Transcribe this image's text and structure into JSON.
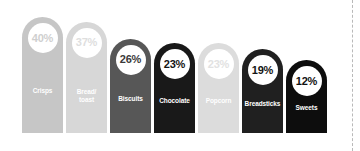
{
  "chart_data": {
    "type": "bar",
    "title": "",
    "subtitle": "",
    "xlabel": "",
    "ylabel": "",
    "ylim": [
      0,
      40
    ],
    "grid": false,
    "legend": "none",
    "orientation": "vertical",
    "bar_top_shape": "rounded-dome",
    "value_suffix": "%",
    "categories": [
      "Crisps",
      "Bread/\ntoast",
      "Biscuits",
      "Chocolate",
      "Popcorn",
      "Breadsticks",
      "Sweets"
    ],
    "values": [
      40,
      37,
      26,
      23,
      23,
      19,
      12
    ],
    "value_labels": [
      "40%",
      "37%",
      "26%",
      "23%",
      "23%",
      "19%",
      "12%"
    ],
    "bars": [
      {
        "category": "Crisps",
        "value": 40,
        "value_label": "40%",
        "bar_color": "#c6c6c6",
        "bubble_color": "#ffffff",
        "value_text_color": "#cfcfcf",
        "label_text_color": "#ffffff"
      },
      {
        "category": "Bread/\ntoast",
        "value": 37,
        "value_label": "37%",
        "bar_color": "#d7d7d7",
        "bubble_color": "#ffffff",
        "value_text_color": "#dedede",
        "label_text_color": "#ffffff"
      },
      {
        "category": "Biscuits",
        "value": 26,
        "value_label": "26%",
        "bar_color": "#575757",
        "bubble_color": "#ffffff",
        "value_text_color": "#3a3a3a",
        "label_text_color": "#ffffff"
      },
      {
        "category": "Chocolate",
        "value": 23,
        "value_label": "23%",
        "bar_color": "#191919",
        "bubble_color": "#ffffff",
        "value_text_color": "#141414",
        "label_text_color": "#ffffff"
      },
      {
        "category": "Popcorn",
        "value": 23,
        "value_label": "23%",
        "bar_color": "#dcdcdc",
        "bubble_color": "#ffffff",
        "value_text_color": "#e2e2e2",
        "label_text_color": "#ffffff"
      },
      {
        "category": "Breadsticks",
        "value": 19,
        "value_label": "19%",
        "bar_color": "#202020",
        "bubble_color": "#ffffff",
        "value_text_color": "#141414",
        "label_text_color": "#ffffff"
      },
      {
        "category": "Sweets",
        "value": 12,
        "value_label": "12%",
        "bar_color": "#0d0d0d",
        "bubble_color": "#ffffff",
        "value_text_color": "#111111",
        "label_text_color": "#ffffff"
      }
    ]
  },
  "decor": {
    "divider_style": "dashed",
    "divider_color": "#b9b9b9",
    "background_color": "#ffffff"
  }
}
